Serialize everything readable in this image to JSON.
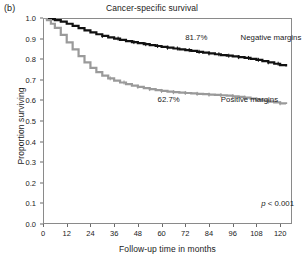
{
  "panel": {
    "label": "(b)"
  },
  "title": "Cancer-specific survival",
  "axes": {
    "ylabel": "Proportion surviving",
    "xlabel": "Follow-up time in months"
  },
  "statistics": {
    "p_value_prefix": "p",
    "p_value_text": " < 0.001"
  },
  "annotations": {
    "negative_pct": "81.7%",
    "negative_label": "Negative margins",
    "positive_pct": "62.7%",
    "positive_label": "Positive margins"
  },
  "colors": {
    "negative_curve": "#111111",
    "positive_curve": "#9a9a9a",
    "frame": "#8a8a8a",
    "text": "#1a1a1a"
  },
  "chart_data": {
    "type": "line",
    "title": "Cancer-specific survival",
    "xlabel": "Follow-up time in months",
    "ylabel": "Proportion surviving",
    "xlim": [
      0,
      126
    ],
    "ylim": [
      0.0,
      1.0
    ],
    "xticks": [
      0,
      12,
      24,
      36,
      48,
      60,
      72,
      84,
      96,
      108,
      120
    ],
    "yticks": [
      0.0,
      0.1,
      0.2,
      0.3,
      0.4,
      0.5,
      0.6,
      0.7,
      0.8,
      0.9,
      1.0
    ],
    "grid": false,
    "legend": "inline-annotations",
    "annotations": [
      {
        "text": "81.7%",
        "x": 72,
        "y": 0.905,
        "series": "Negative margins"
      },
      {
        "text": "Negative margins",
        "x": 100,
        "y": 0.905,
        "series": "Negative margins"
      },
      {
        "text": "62.7%",
        "x": 58,
        "y": 0.6,
        "series": "Positive margins"
      },
      {
        "text": "Positive margins",
        "x": 90,
        "y": 0.6,
        "series": "Positive margins"
      },
      {
        "text": "p < 0.001",
        "x": 112,
        "y": 0.14,
        "series": "stat"
      }
    ],
    "series": [
      {
        "name": "Negative margins",
        "color": "#111111",
        "endpoint_value": 0.817,
        "x": [
          0,
          2,
          4,
          6,
          9,
          12,
          15,
          18,
          21,
          24,
          27,
          30,
          33,
          36,
          39,
          42,
          45,
          48,
          51,
          54,
          57,
          60,
          63,
          66,
          69,
          72,
          75,
          78,
          81,
          84,
          87,
          90,
          93,
          96,
          99,
          102,
          105,
          108,
          111,
          114,
          117,
          120,
          123
        ],
        "values": [
          1.0,
          0.998,
          0.995,
          0.99,
          0.982,
          0.972,
          0.962,
          0.951,
          0.94,
          0.93,
          0.921,
          0.913,
          0.906,
          0.9,
          0.894,
          0.888,
          0.883,
          0.878,
          0.873,
          0.868,
          0.864,
          0.86,
          0.856,
          0.852,
          0.848,
          0.844,
          0.84,
          0.836,
          0.832,
          0.828,
          0.824,
          0.82,
          0.817,
          0.814,
          0.81,
          0.806,
          0.802,
          0.797,
          0.791,
          0.785,
          0.778,
          0.771,
          0.765
        ]
      },
      {
        "name": "Positive margins",
        "color": "#9a9a9a",
        "endpoint_value": 0.627,
        "x": [
          0,
          2,
          4,
          6,
          9,
          12,
          15,
          18,
          21,
          24,
          27,
          30,
          33,
          36,
          39,
          42,
          45,
          48,
          51,
          54,
          57,
          60,
          63,
          66,
          69,
          72,
          75,
          78,
          81,
          84,
          87,
          90,
          93,
          96,
          99,
          102,
          105,
          108,
          111,
          114,
          117,
          120,
          123
        ],
        "values": [
          1.0,
          0.99,
          0.972,
          0.952,
          0.918,
          0.882,
          0.848,
          0.815,
          0.785,
          0.758,
          0.737,
          0.72,
          0.707,
          0.696,
          0.687,
          0.679,
          0.672,
          0.666,
          0.66,
          0.655,
          0.65,
          0.646,
          0.643,
          0.64,
          0.638,
          0.636,
          0.634,
          0.632,
          0.63,
          0.628,
          0.627,
          0.625,
          0.623,
          0.62,
          0.617,
          0.613,
          0.609,
          0.604,
          0.599,
          0.594,
          0.59,
          0.586,
          0.583
        ]
      }
    ],
    "censor_marks": {
      "Negative margins": [
        30,
        38,
        46,
        52,
        58,
        63,
        68,
        74,
        79,
        84,
        89,
        94,
        99,
        104,
        109,
        114,
        119
      ],
      "Positive margins": [
        34,
        41,
        48,
        54,
        60,
        66,
        72,
        78,
        84,
        90,
        96,
        102,
        108,
        114,
        120
      ]
    }
  }
}
